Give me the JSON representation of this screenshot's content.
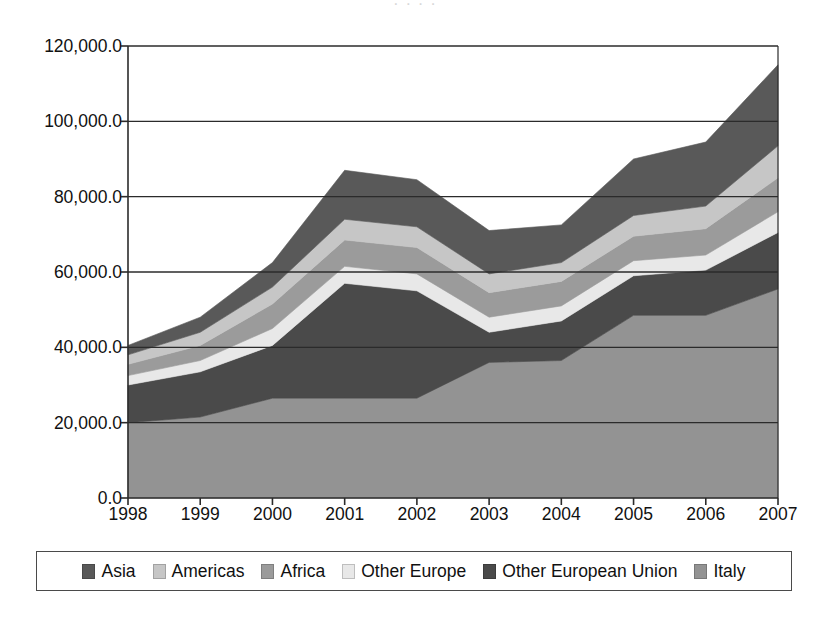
{
  "figure": {
    "title_remnant": "· · · ·",
    "background": "#ffffff",
    "frame_color": "#4a4a4a"
  },
  "axis": {
    "y_ticks": [
      "0.0",
      "20,000.0",
      "40,000.0",
      "60,000.0",
      "80,000.0",
      "100,000.0",
      "120,000.0"
    ],
    "x_ticks": [
      "1998",
      "1999",
      "2000",
      "2001",
      "2002",
      "2003",
      "2004",
      "2005",
      "2006",
      "2007"
    ]
  },
  "legend": {
    "items": [
      {
        "label": "Asia",
        "color": "#595959"
      },
      {
        "label": "Americas",
        "color": "#c6c6c6"
      },
      {
        "label": "Africa",
        "color": "#9b9b9b"
      },
      {
        "label": "Other Europe",
        "color": "#e8e8e8"
      },
      {
        "label": "Other European Union",
        "color": "#4a4a4a"
      },
      {
        "label": "Italy",
        "color": "#939393"
      }
    ]
  },
  "chart_data": {
    "type": "area",
    "stacked": true,
    "title": "",
    "xlabel": "",
    "ylabel": "",
    "ylim": [
      0,
      120000
    ],
    "xlim": [
      "1998",
      "2007"
    ],
    "grid": true,
    "legend_position": "bottom",
    "categories": [
      "1998",
      "1999",
      "2000",
      "2001",
      "2002",
      "2003",
      "2004",
      "2005",
      "2006",
      "2007"
    ],
    "stack_order_bottom_to_top": [
      "Italy",
      "Other European Union",
      "Other Europe",
      "Africa",
      "Americas",
      "Asia"
    ],
    "series": [
      {
        "name": "Italy",
        "color": "#939393",
        "values": [
          20000,
          21500,
          26500,
          26500,
          26500,
          36000,
          36500,
          48500,
          48500,
          55500
        ]
      },
      {
        "name": "Other European Union",
        "color": "#4a4a4a",
        "values": [
          10000,
          12000,
          14000,
          30500,
          28500,
          8000,
          10500,
          10500,
          12000,
          15000
        ]
      },
      {
        "name": "Other Europe",
        "color": "#e8e8e8",
        "values": [
          2500,
          3000,
          4500,
          4500,
          4500,
          4000,
          4000,
          4000,
          4000,
          5500
        ]
      },
      {
        "name": "Africa",
        "color": "#9b9b9b",
        "values": [
          3000,
          4000,
          6500,
          7000,
          7000,
          6500,
          6500,
          6500,
          7000,
          9000
        ]
      },
      {
        "name": "Americas",
        "color": "#c6c6c6",
        "values": [
          2500,
          3500,
          4500,
          5500,
          5500,
          5000,
          5000,
          5500,
          6000,
          8500
        ]
      },
      {
        "name": "Asia",
        "color": "#595959",
        "values": [
          2500,
          4000,
          6500,
          13000,
          12500,
          11500,
          10000,
          15000,
          17000,
          21500
        ]
      }
    ],
    "cumulative_totals": [
      40500,
      48000,
      62500,
      87000,
      84500,
      71000,
      72500,
      90000,
      94500,
      115000
    ]
  }
}
